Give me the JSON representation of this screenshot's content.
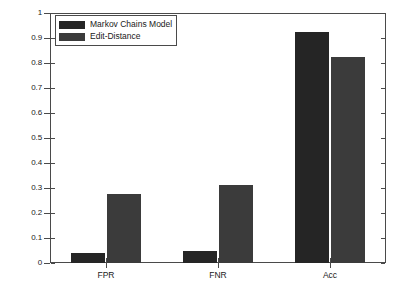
{
  "chart_data": {
    "type": "bar",
    "title": "",
    "xlabel": "",
    "ylabel": "",
    "categories": [
      "FPR",
      "FNR",
      "Acc"
    ],
    "series": [
      {
        "name": "Markov Chains Model",
        "values": [
          0.04,
          0.047,
          0.925
        ],
        "color": "#252525"
      },
      {
        "name": "Edit-Distance",
        "values": [
          0.275,
          0.312,
          0.825
        ],
        "color": "#3b3b3b"
      }
    ],
    "ylim": [
      0,
      1
    ],
    "yticks": [
      0,
      0.1,
      0.2,
      0.3,
      0.4,
      0.5,
      0.6,
      0.7,
      0.8,
      0.9,
      1
    ],
    "ytick_labels": [
      "0",
      "0.1",
      "0.2",
      "0.3",
      "0.4",
      "0.5",
      "0.6",
      "0.7",
      "0.8",
      "0.9",
      "1"
    ],
    "grid": false,
    "legend_position": "top-left"
  },
  "legend": {
    "entries": [
      {
        "label": "Markov Chains Model"
      },
      {
        "label": "Edit-Distance"
      }
    ]
  }
}
